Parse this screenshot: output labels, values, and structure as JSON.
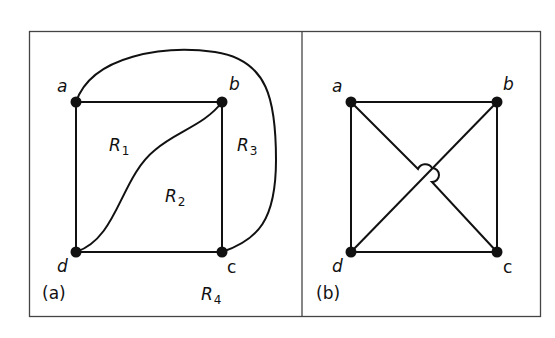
{
  "figure": {
    "panels": [
      {
        "id": "a",
        "caption": "(a)",
        "vertices": [
          {
            "name": "a",
            "x": 76,
            "y": 102
          },
          {
            "name": "b",
            "x": 222,
            "y": 102
          },
          {
            "name": "c",
            "x": 222,
            "y": 252
          },
          {
            "name": "d",
            "x": 76,
            "y": 252
          }
        ],
        "edges": [
          [
            "a",
            "b"
          ],
          [
            "b",
            "c"
          ],
          [
            "c",
            "d"
          ],
          [
            "d",
            "a"
          ],
          [
            "b",
            "d"
          ],
          [
            "a",
            "c"
          ]
        ],
        "regions": [
          {
            "letter": "R",
            "sub": "1"
          },
          {
            "letter": "R",
            "sub": "2"
          },
          {
            "letter": "R",
            "sub": "3"
          },
          {
            "letter": "R",
            "sub": "4"
          }
        ]
      },
      {
        "id": "b",
        "caption": "(b)",
        "vertices": [
          {
            "name": "a",
            "x": 351,
            "y": 102
          },
          {
            "name": "b",
            "x": 497,
            "y": 102
          },
          {
            "name": "c",
            "x": 497,
            "y": 252
          },
          {
            "name": "d",
            "x": 351,
            "y": 252
          }
        ],
        "edges": [
          [
            "a",
            "b"
          ],
          [
            "b",
            "c"
          ],
          [
            "c",
            "d"
          ],
          [
            "d",
            "a"
          ],
          [
            "a",
            "c"
          ],
          [
            "b",
            "d"
          ]
        ]
      }
    ]
  },
  "colors": {
    "stroke": "#111111",
    "frame": "#444444",
    "background": "#ffffff"
  }
}
